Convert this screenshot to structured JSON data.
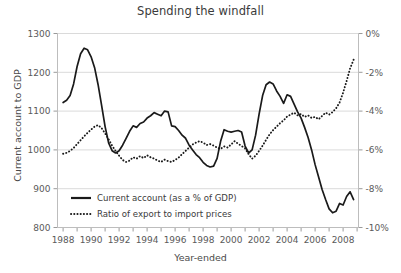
{
  "chart_data": {
    "type": "line",
    "title": "Spending the windfall",
    "xlabel": "Year-ended",
    "ylabel": "Current account to GDP",
    "ylabel_right": "",
    "grid": true,
    "legend_position": "bottom-left",
    "xlim": [
      1987.6,
      2009.1
    ],
    "ylim": [
      800,
      1300
    ],
    "ylim_right": [
      -10,
      0
    ],
    "xticks_major": [
      1988,
      1990,
      1992,
      1994,
      1996,
      1998,
      2000,
      2002,
      2004,
      2006,
      2008
    ],
    "xticks_minor": [
      1989,
      1991,
      1993,
      1995,
      1997,
      1999,
      2001,
      2003,
      2005,
      2007,
      2009
    ],
    "yticks_left": [
      800,
      900,
      1000,
      1100,
      1200,
      1300
    ],
    "ytick_labels_left": [
      "800",
      "900",
      "1000",
      "1100",
      "1200",
      "1300"
    ],
    "yticks_right": [
      0,
      -2,
      -4,
      -6,
      -8,
      -10
    ],
    "ytick_labels_right": [
      "0%",
      "-2%",
      "-4%",
      "-6%",
      "-8%",
      "-10%"
    ],
    "series": [
      {
        "name": "Current account (as a % of GDP)",
        "style": "solid",
        "color": "#1a1a1a",
        "axis": "left",
        "x": [
          1988.0,
          1988.25,
          1988.5,
          1988.75,
          1989.0,
          1989.25,
          1989.5,
          1989.75,
          1990.0,
          1990.25,
          1990.5,
          1990.75,
          1991.0,
          1991.25,
          1991.5,
          1991.75,
          1992.0,
          1992.25,
          1992.5,
          1992.75,
          1993.0,
          1993.25,
          1993.5,
          1993.75,
          1994.0,
          1994.25,
          1994.5,
          1994.75,
          1995.0,
          1995.25,
          1995.5,
          1995.75,
          1996.0,
          1996.25,
          1996.5,
          1996.75,
          1997.0,
          1997.25,
          1997.5,
          1997.75,
          1998.0,
          1998.25,
          1998.5,
          1998.75,
          1999.0,
          1999.25,
          1999.5,
          1999.75,
          2000.0,
          2000.25,
          2000.5,
          2000.75,
          2001.0,
          2001.25,
          2001.5,
          2001.75,
          2002.0,
          2002.25,
          2002.5,
          2002.75,
          2003.0,
          2003.25,
          2003.5,
          2003.75,
          2004.0,
          2004.25,
          2004.5,
          2004.75,
          2005.0,
          2005.25,
          2005.5,
          2005.75,
          2006.0,
          2006.25,
          2006.5,
          2006.75,
          2007.0,
          2007.25,
          2007.5,
          2007.75,
          2008.0,
          2008.25,
          2008.5,
          2008.75
        ],
        "values": [
          1122,
          1128,
          1140,
          1170,
          1215,
          1248,
          1262,
          1258,
          1240,
          1212,
          1168,
          1115,
          1060,
          1018,
          998,
          992,
          998,
          1012,
          1030,
          1048,
          1062,
          1058,
          1068,
          1072,
          1082,
          1088,
          1096,
          1092,
          1088,
          1100,
          1098,
          1062,
          1060,
          1050,
          1038,
          1030,
          1012,
          1000,
          988,
          980,
          968,
          960,
          956,
          958,
          978,
          1022,
          1052,
          1048,
          1046,
          1048,
          1050,
          1046,
          1010,
          992,
          1000,
          1038,
          1092,
          1140,
          1168,
          1175,
          1170,
          1152,
          1138,
          1120,
          1142,
          1138,
          1118,
          1098,
          1082,
          1058,
          1032,
          1000,
          962,
          930,
          898,
          872,
          848,
          838,
          842,
          862,
          858,
          880,
          892,
          872
        ]
      },
      {
        "name": "Ratio of export to import prices",
        "style": "dotted",
        "color": "#1a1a1a",
        "axis": "right",
        "x": [
          1988.0,
          1988.25,
          1988.5,
          1988.75,
          1989.0,
          1989.25,
          1989.5,
          1989.75,
          1990.0,
          1990.25,
          1990.5,
          1990.75,
          1991.0,
          1991.25,
          1991.5,
          1991.75,
          1992.0,
          1992.25,
          1992.5,
          1992.75,
          1993.0,
          1993.25,
          1993.5,
          1993.75,
          1994.0,
          1994.25,
          1994.5,
          1994.75,
          1995.0,
          1995.25,
          1995.5,
          1995.75,
          1996.0,
          1996.25,
          1996.5,
          1996.75,
          1997.0,
          1997.25,
          1997.5,
          1997.75,
          1998.0,
          1998.25,
          1998.5,
          1998.75,
          1999.0,
          1999.25,
          1999.5,
          1999.75,
          2000.0,
          2000.25,
          2000.5,
          2000.75,
          2001.0,
          2001.25,
          2001.5,
          2001.75,
          2002.0,
          2002.25,
          2002.5,
          2002.75,
          2003.0,
          2003.25,
          2003.5,
          2003.75,
          2004.0,
          2004.25,
          2004.5,
          2004.75,
          2005.0,
          2005.25,
          2005.5,
          2005.75,
          2006.0,
          2006.25,
          2006.5,
          2006.75,
          2007.0,
          2007.25,
          2007.5,
          2007.75,
          2008.0,
          2008.25,
          2008.5,
          2008.75
        ],
        "values": [
          -6.2,
          -6.15,
          -6.05,
          -5.9,
          -5.7,
          -5.5,
          -5.3,
          -5.12,
          -4.95,
          -4.8,
          -4.72,
          -4.88,
          -5.15,
          -5.45,
          -5.78,
          -6.05,
          -6.3,
          -6.52,
          -6.62,
          -6.55,
          -6.38,
          -6.45,
          -6.32,
          -6.42,
          -6.28,
          -6.38,
          -6.45,
          -6.55,
          -6.62,
          -6.5,
          -6.58,
          -6.62,
          -6.52,
          -6.4,
          -6.22,
          -6.05,
          -5.88,
          -5.72,
          -5.62,
          -5.55,
          -5.62,
          -5.75,
          -5.7,
          -5.78,
          -5.88,
          -5.95,
          -5.82,
          -5.88,
          -5.72,
          -5.55,
          -5.68,
          -5.8,
          -5.92,
          -6.22,
          -6.45,
          -6.3,
          -6.05,
          -5.78,
          -5.48,
          -5.2,
          -4.98,
          -4.8,
          -4.62,
          -4.48,
          -4.28,
          -4.18,
          -4.08,
          -4.22,
          -4.15,
          -4.3,
          -4.22,
          -4.35,
          -4.3,
          -4.42,
          -4.25,
          -4.08,
          -4.18,
          -4.05,
          -3.85,
          -3.55,
          -3.05,
          -2.45,
          -1.8,
          -1.35
        ]
      }
    ],
    "legend": [
      {
        "label": "Current account (as a % of GDP)",
        "style": "solid"
      },
      {
        "label": "Ratio of export to import prices",
        "style": "dotted"
      }
    ]
  }
}
